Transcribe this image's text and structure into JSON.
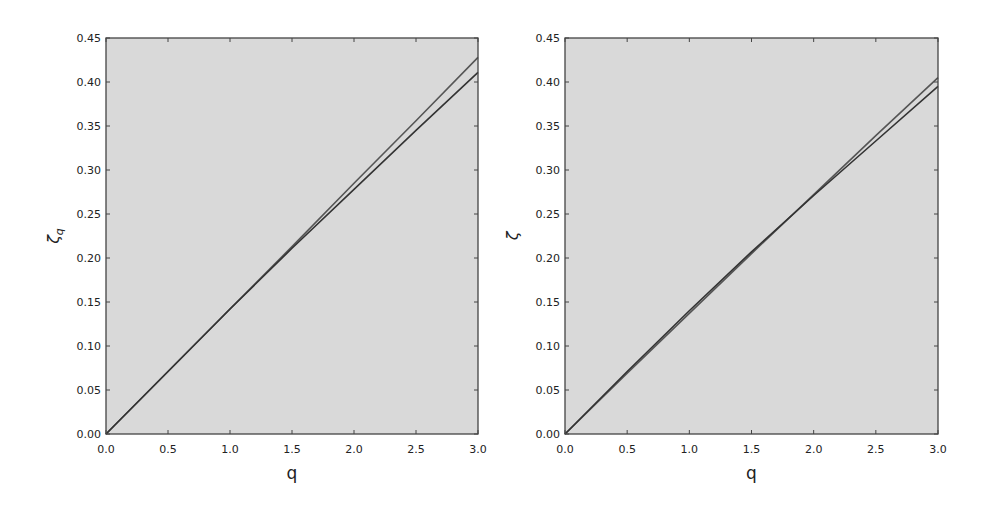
{
  "chart_data": [
    {
      "type": "line",
      "title": "",
      "xlabel": "q",
      "ylabel": "ζ_q",
      "xlim": [
        0.0,
        3.0
      ],
      "ylim": [
        0.0,
        0.45
      ],
      "xticks": [
        "0.0",
        "0.5",
        "1.0",
        "1.5",
        "2.0",
        "2.5",
        "3.0"
      ],
      "yticks": [
        "0.00",
        "0.05",
        "0.10",
        "0.15",
        "0.20",
        "0.25",
        "0.30",
        "0.35",
        "0.40",
        "0.45"
      ],
      "grid": false,
      "legend": null,
      "background": "#d9d9d9",
      "x": [
        0.0,
        0.5,
        1.0,
        1.5,
        2.0,
        2.5,
        3.0
      ],
      "series": [
        {
          "name": "upper",
          "color": "#555555",
          "values": [
            0.0,
            0.071,
            0.142,
            0.213,
            0.285,
            0.356,
            0.428
          ]
        },
        {
          "name": "lower",
          "color": "#333333",
          "values": [
            0.0,
            0.071,
            0.142,
            0.211,
            0.278,
            0.345,
            0.411
          ]
        }
      ]
    },
    {
      "type": "line",
      "title": "",
      "xlabel": "q",
      "ylabel": "ζ",
      "xlim": [
        0.0,
        3.0
      ],
      "ylim": [
        0.0,
        0.45
      ],
      "xticks": [
        "0.0",
        "0.5",
        "1.0",
        "1.5",
        "2.0",
        "2.5",
        "3.0"
      ],
      "yticks": [
        "0.00",
        "0.05",
        "0.10",
        "0.15",
        "0.20",
        "0.25",
        "0.30",
        "0.35",
        "0.40",
        "0.45"
      ],
      "grid": false,
      "legend": null,
      "background": "#d9d9d9",
      "x": [
        0.0,
        0.5,
        1.0,
        1.5,
        2.0,
        2.5,
        3.0
      ],
      "series": [
        {
          "name": "upper",
          "color": "#555555",
          "values": [
            0.0,
            0.069,
            0.137,
            0.205,
            0.272,
            0.339,
            0.405
          ]
        },
        {
          "name": "lower",
          "color": "#333333",
          "values": [
            0.0,
            0.071,
            0.14,
            0.207,
            0.271,
            0.333,
            0.395
          ]
        }
      ]
    }
  ]
}
